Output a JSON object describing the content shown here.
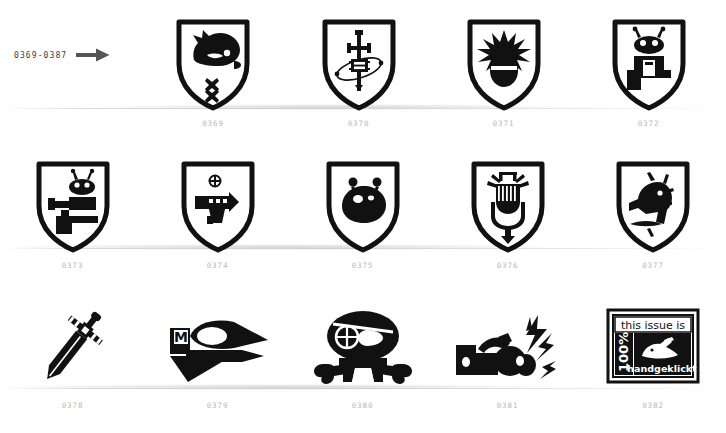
{
  "page": {
    "background_color": "#ffffff",
    "ink_color": "#111111",
    "caption_color": "#b9b9b9"
  },
  "range_marker": {
    "label": "0369-0387",
    "arrow_icon": "arrow-right-icon"
  },
  "rows": [
    {
      "name": "row-1",
      "items": [
        {
          "caption": "0369",
          "icon": "shield-badger-head-icon",
          "alt": "shield with badger head and small cross ornament"
        },
        {
          "caption": "0370",
          "icon": "shield-sword-circuit-icon",
          "alt": "shield with sword through a circuit chip and orbit"
        },
        {
          "caption": "0371",
          "icon": "shield-bomb-blast-icon",
          "alt": "shield with exploding bomb"
        },
        {
          "caption": "0372",
          "icon": "shield-robot-desk-icon",
          "alt": "shield with antennaed robot at a desk"
        }
      ]
    },
    {
      "name": "row-2",
      "items": [
        {
          "caption": "0373",
          "icon": "shield-alien-raygun-icon",
          "alt": "shield with alien firing a ray gun at a desk"
        },
        {
          "caption": "0374",
          "icon": "shield-blaster-pistol-icon",
          "alt": "shield with sci-fi blaster pistol"
        },
        {
          "caption": "0375",
          "icon": "shield-blob-alien-icon",
          "alt": "shield with round blob alien with antennae"
        },
        {
          "caption": "0376",
          "icon": "shield-microphone-icon",
          "alt": "shield with vintage microphone emitting sound"
        },
        {
          "caption": "0377",
          "icon": "shield-shouting-head-icon",
          "alt": "shield with shouting head and lightning"
        }
      ]
    },
    {
      "name": "row-3",
      "items": [
        {
          "caption": "0378",
          "icon": "sword-diagonal-icon",
          "alt": "diagonal broadsword"
        },
        {
          "caption": "0379",
          "icon": "rocket-ship-icon",
          "alt": "rocket ship marked with letter M"
        },
        {
          "caption": "0380",
          "icon": "pirate-skull-icon",
          "alt": "skull with eyepatch over crossbones"
        },
        {
          "caption": "0381",
          "icon": "hand-mouse-lightning-icon",
          "alt": "hand clicking a mouse with lightning bolts"
        },
        {
          "caption": "0382",
          "icon": "handgeklickt-stamp-icon",
          "alt": "stamp badge: this issue is 100% handgeklickt"
        }
      ]
    }
  ],
  "stamp": {
    "line_top": "this issue is",
    "percent": "100%",
    "line_bottom": "handgeklickt",
    "icon": "hand-mouse-icon"
  }
}
